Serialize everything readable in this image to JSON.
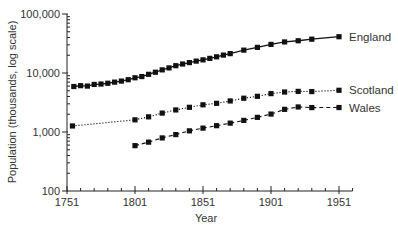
{
  "chart_data": {
    "type": "line",
    "title": "",
    "xlabel": "Year",
    "ylabel": "Population (thousands, log scale)",
    "yscale": "log",
    "xlim": [
      1751,
      1961
    ],
    "ylim": [
      100,
      100000
    ],
    "x_ticks": [
      1751,
      1801,
      1851,
      1901,
      1951
    ],
    "x_tick_labels": [
      "1751",
      "1801",
      "1851",
      "1901",
      "1951"
    ],
    "y_ticks": [
      100,
      1000,
      10000,
      100000
    ],
    "y_tick_labels": [
      "100",
      "1,000",
      "10,000",
      "100,000"
    ],
    "grid": false,
    "legend_position": "inline-right",
    "series": [
      {
        "name": "England",
        "line_style": "solid",
        "marker": "square",
        "x": [
          1756,
          1761,
          1766,
          1771,
          1776,
          1781,
          1786,
          1791,
          1796,
          1801,
          1806,
          1811,
          1816,
          1821,
          1826,
          1831,
          1836,
          1841,
          1846,
          1851,
          1856,
          1861,
          1866,
          1871,
          1881,
          1891,
          1901,
          1911,
          1921,
          1931,
          1951
        ],
        "values": [
          5900,
          6100,
          6000,
          6400,
          6500,
          6700,
          7000,
          7300,
          7700,
          8300,
          8700,
          9500,
          10300,
          11300,
          12200,
          13300,
          14200,
          15000,
          15900,
          16700,
          17700,
          18800,
          20100,
          21300,
          24400,
          27200,
          30500,
          33600,
          35200,
          37400,
          41200
        ]
      },
      {
        "name": "Scotland",
        "line_style": "dotted",
        "marker": "square",
        "x": [
          1755,
          1801,
          1811,
          1821,
          1831,
          1841,
          1851,
          1861,
          1871,
          1881,
          1891,
          1901,
          1911,
          1921,
          1931,
          1951
        ],
        "values": [
          1265,
          1608,
          1806,
          2092,
          2364,
          2620,
          2889,
          3062,
          3360,
          3736,
          4026,
          4472,
          4761,
          4882,
          4843,
          5096
        ]
      },
      {
        "name": "Wales",
        "line_style": "dashed",
        "marker": "square",
        "x": [
          1801,
          1811,
          1821,
          1831,
          1841,
          1851,
          1861,
          1871,
          1881,
          1891,
          1901,
          1911,
          1921,
          1931,
          1951
        ],
        "values": [
          587,
          673,
          794,
          904,
          1046,
          1163,
          1280,
          1413,
          1572,
          1771,
          2013,
          2421,
          2656,
          2593,
          2599
        ]
      }
    ]
  }
}
